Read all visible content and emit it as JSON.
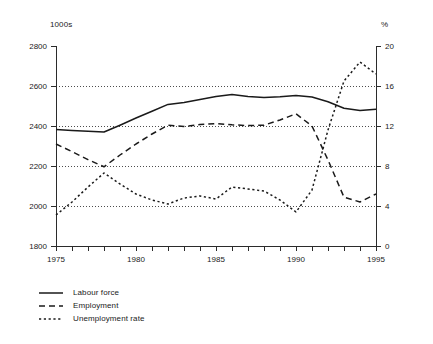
{
  "chart_data": {
    "type": "line",
    "title": "",
    "xlabel": "",
    "x": [
      1975,
      1976,
      1977,
      1978,
      1979,
      1980,
      1981,
      1982,
      1983,
      1984,
      1985,
      1986,
      1987,
      1988,
      1989,
      1990,
      1991,
      1992,
      1993,
      1994,
      1995
    ],
    "xlim": [
      1975,
      1995
    ],
    "xticks": [
      1975,
      1976,
      1977,
      1978,
      1979,
      1980,
      1981,
      1982,
      1983,
      1984,
      1985,
      1986,
      1987,
      1988,
      1989,
      1990,
      1991,
      1992,
      1993,
      1994,
      1995
    ],
    "xtick_labels": [
      "1975",
      "",
      "",
      "",
      "",
      "1980",
      "",
      "",
      "",
      "",
      "1985",
      "",
      "",
      "",
      "",
      "1990",
      "",
      "",
      "",
      "",
      "1995"
    ],
    "grid": true,
    "legend_position": "below-left",
    "axes": [
      {
        "id": "left",
        "unit_label": "1000s",
        "ylabel": "",
        "ylim": [
          1800,
          2800
        ],
        "yticks": [
          1800,
          2000,
          2200,
          2400,
          2600,
          2800
        ],
        "ytick_labels": [
          "1800",
          "2000",
          "2200",
          "2400",
          "2600",
          "2800"
        ]
      },
      {
        "id": "right",
        "unit_label": "%",
        "ylabel": "",
        "ylim": [
          0,
          20
        ],
        "yticks": [
          0,
          4,
          8,
          12,
          16,
          20
        ],
        "ytick_labels": [
          "0",
          "4",
          "8",
          "12",
          "16",
          "20"
        ]
      }
    ],
    "series": [
      {
        "name": "Labour force",
        "axis": "left",
        "style": "solid",
        "values": [
          2383,
          2378,
          2374,
          2370,
          2404,
          2440,
          2474,
          2508,
          2518,
          2533,
          2547,
          2558,
          2548,
          2543,
          2546,
          2553,
          2545,
          2521,
          2489,
          2478,
          2484
        ]
      },
      {
        "name": "Employment",
        "axis": "left",
        "style": "dashed",
        "values": [
          2310,
          2272,
          2232,
          2196,
          2255,
          2310,
          2360,
          2404,
          2398,
          2407,
          2412,
          2406,
          2402,
          2404,
          2430,
          2461,
          2400,
          2230,
          2044,
          2020,
          2060
        ]
      },
      {
        "name": "Unemployment rate",
        "axis": "right",
        "style": "dotted",
        "values": [
          3.1,
          4.4,
          5.9,
          7.3,
          6.2,
          5.2,
          4.6,
          4.2,
          4.8,
          5.0,
          4.7,
          5.9,
          5.7,
          5.5,
          4.6,
          3.4,
          5.6,
          11.6,
          16.5,
          18.4,
          17.2
        ]
      }
    ]
  },
  "legend": {
    "items": [
      {
        "label": "Labour force",
        "style": "solid"
      },
      {
        "label": "Employment",
        "style": "dashed"
      },
      {
        "label": "Unemployment rate",
        "style": "dotted"
      }
    ]
  }
}
